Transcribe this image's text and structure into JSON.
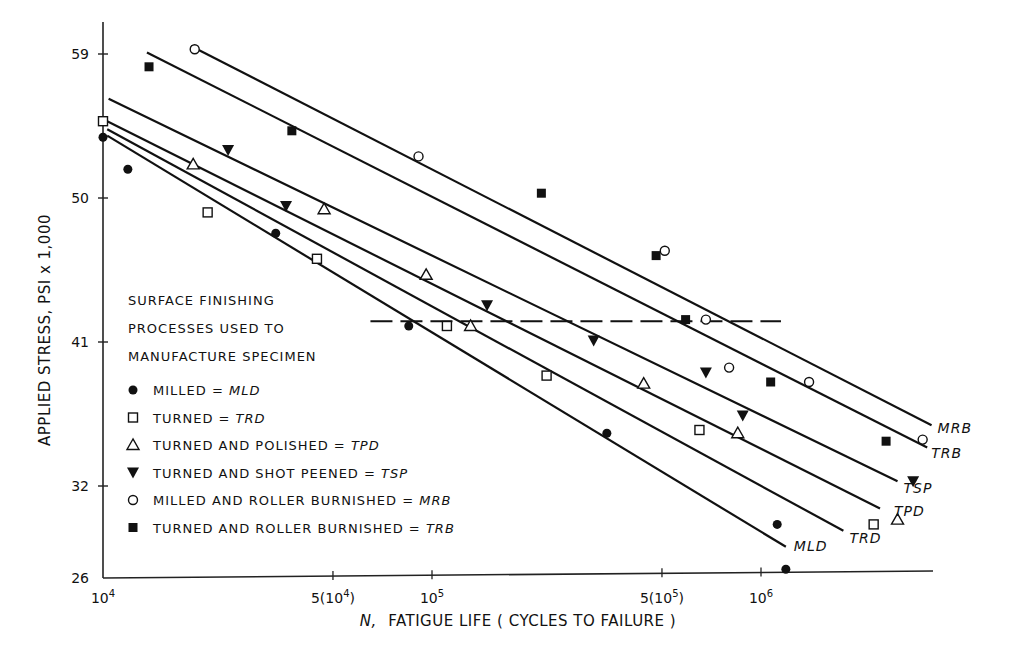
{
  "chart_data": {
    "type": "scatter",
    "title": "",
    "xlabel": "N, FATIGUE LIFE (CYCLES TO FAILURE)",
    "xlabel_prefix": "N,",
    "xlabel_rest": "FATIGUE LIFE ( CYCLES TO FAILURE )",
    "ylabel": "APPLIED STRESS, PSI x 1,000",
    "x_scale": "log",
    "y_scale": "log",
    "xlim": [
      10000,
      4000000
    ],
    "ylim": [
      26,
      61
    ],
    "grid": false,
    "x_ticks": [
      {
        "value": 10000,
        "label_base": "10",
        "label_exp": "4",
        "label_prefix": ""
      },
      {
        "value": 50000,
        "label_base": "10",
        "label_exp": "4",
        "label_prefix": "5("
      },
      {
        "value": 100000,
        "label_base": "10",
        "label_exp": "5",
        "label_prefix": ""
      },
      {
        "value": 500000,
        "label_base": "10",
        "label_exp": "5",
        "label_prefix": "5("
      },
      {
        "value": 1000000,
        "label_base": "10",
        "label_exp": "6",
        "label_prefix": ""
      }
    ],
    "y_ticks": [
      {
        "value": 59,
        "label": "59"
      },
      {
        "value": 50,
        "label": "50"
      },
      {
        "value": 41,
        "label": "41"
      },
      {
        "value": 32,
        "label": "32"
      },
      {
        "value": 26,
        "label": "26"
      }
    ],
    "legend": {
      "position": "lower-left",
      "heading": [
        "SURFACE FINISHING",
        "PROCESSES USED TO",
        "MANUFACTURE SPECIMEN"
      ],
      "entries": [
        {
          "marker": "filled-circle",
          "text": "MILLED =",
          "code": "MLD"
        },
        {
          "marker": "open-square",
          "text": "TURNED =",
          "code": "TRD"
        },
        {
          "marker": "open-triangle",
          "text": "TURNED AND POLISHED =",
          "code": "TPD"
        },
        {
          "marker": "filled-inverted-triangle",
          "text": "TURNED AND SHOT PEENED =",
          "code": "TSP"
        },
        {
          "marker": "open-circle",
          "text": "MILLED AND ROLLER BURNISHED =",
          "code": "MRB"
        },
        {
          "marker": "filled-square",
          "text": "TURNED AND ROLLER BURNISHED =",
          "code": "TRB"
        }
      ]
    },
    "reference_line": {
      "style": "dashed",
      "stress": 42.3,
      "x_from": 65000,
      "x_to": 1150000
    },
    "series": [
      {
        "name": "MLD",
        "label": "MILLED",
        "marker": "filled-circle",
        "points": [
          [
            10000,
            53.8
          ],
          [
            11900,
            51.8
          ],
          [
            33500,
            47.8
          ],
          [
            85000,
            42.0
          ],
          [
            340000,
            35.3
          ],
          [
            1120000,
            29.6
          ],
          [
            1190000,
            26.8
          ]
        ],
        "fit_line": [
          [
            10300,
            53.9
          ],
          [
            1190000,
            28.2
          ]
        ]
      },
      {
        "name": "TRD",
        "label": "TURNED",
        "marker": "open-square",
        "points": [
          [
            10000,
            54.8
          ],
          [
            20800,
            49.1
          ],
          [
            44700,
            46.2
          ],
          [
            111000,
            42.0
          ],
          [
            223000,
            38.9
          ],
          [
            650000,
            35.5
          ],
          [
            2200000,
            29.6
          ]
        ],
        "fit_line": [
          [
            10300,
            54.3
          ],
          [
            1780000,
            29.2
          ]
        ]
      },
      {
        "name": "TPD",
        "label": "TURNED AND POLISHED",
        "marker": "open-triangle",
        "points": [
          [
            18800,
            52.1
          ],
          [
            47000,
            49.3
          ],
          [
            96000,
            45.2
          ],
          [
            131000,
            42.0
          ],
          [
            440000,
            38.4
          ],
          [
            850000,
            35.3
          ],
          [
            2600000,
            29.9
          ]
        ],
        "fit_line": [
          [
            10300,
            54.8
          ],
          [
            2300000,
            30.6
          ]
        ]
      },
      {
        "name": "TSP",
        "label": "TURNED AND SHOT PEENED",
        "marker": "filled-inverted-triangle",
        "points": [
          [
            24000,
            53.0
          ],
          [
            36000,
            49.5
          ],
          [
            147000,
            43.3
          ],
          [
            310000,
            41.1
          ],
          [
            680000,
            39.1
          ],
          [
            880000,
            36.4
          ],
          [
            2900000,
            32.3
          ]
        ],
        "fit_line": [
          [
            10400,
            56.2
          ],
          [
            2600000,
            32.3
          ]
        ]
      },
      {
        "name": "MRB",
        "label": "MILLED AND ROLLER BURNISHED",
        "marker": "open-circle",
        "points": [
          [
            19000,
            59.3
          ],
          [
            91000,
            52.6
          ],
          [
            510000,
            46.7
          ],
          [
            680000,
            42.4
          ],
          [
            800000,
            39.4
          ],
          [
            1400000,
            38.5
          ],
          [
            3100000,
            34.9
          ]
        ],
        "fit_line": [
          [
            18500,
            59.5
          ],
          [
            3300000,
            35.8
          ]
        ]
      },
      {
        "name": "TRB",
        "label": "TURNED AND ROLLER BURNISHED",
        "marker": "filled-square",
        "points": [
          [
            13800,
            58.2
          ],
          [
            37500,
            54.2
          ],
          [
            215000,
            50.3
          ],
          [
            480000,
            46.4
          ],
          [
            590000,
            42.4
          ],
          [
            1070000,
            38.5
          ],
          [
            2400000,
            34.8
          ]
        ],
        "fit_line": [
          [
            13600,
            59.1
          ],
          [
            3200000,
            34.4
          ]
        ]
      }
    ]
  }
}
